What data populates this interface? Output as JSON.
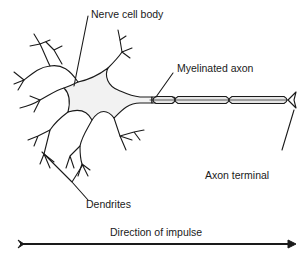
{
  "diagram": {
    "labels": {
      "cell_body": "Nerve cell body",
      "axon": "Myelinated axon",
      "terminal": "Axon terminal",
      "dendrites": "Dendrites",
      "direction": "Direction of impulse"
    },
    "colors": {
      "stroke": "#1a1a1a",
      "cell_fill": "#f2f2f2",
      "myelin_fill": "#e6e6e6"
    }
  }
}
